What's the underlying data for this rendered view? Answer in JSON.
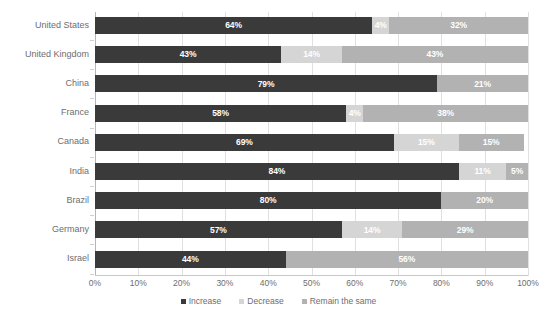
{
  "chart_data": {
    "type": "bar",
    "subtype": "stacked-horizontal-100pct",
    "title": "",
    "xlabel": "",
    "ylabel": "",
    "xlim": [
      0,
      100
    ],
    "xticks": [
      "0%",
      "10%",
      "20%",
      "30%",
      "40%",
      "50%",
      "60%",
      "70%",
      "80%",
      "90%",
      "100%"
    ],
    "xtick_values": [
      0,
      10,
      20,
      30,
      40,
      50,
      60,
      70,
      80,
      90,
      100
    ],
    "grid": true,
    "legend_position": "bottom",
    "categories": [
      "United States",
      "United Kingdom",
      "China",
      "France",
      "Canada",
      "India",
      "Brazil",
      "Germany",
      "Israel"
    ],
    "series": [
      {
        "name": "Increase",
        "color": "#3a3a3a",
        "values": [
          64,
          43,
          79,
          58,
          69,
          84,
          80,
          57,
          44
        ],
        "labels": [
          "64%",
          "43%",
          "79%",
          "58%",
          "69%",
          "84%",
          "80%",
          "57%",
          "44%"
        ]
      },
      {
        "name": "Decrease",
        "color": "#d5d5d5",
        "values": [
          4,
          14,
          0,
          4,
          15,
          11,
          0,
          14,
          0
        ],
        "labels": [
          "4%",
          "14%",
          "",
          "4%",
          "15%",
          "11%",
          "",
          "14%",
          ""
        ]
      },
      {
        "name": "Remain the same",
        "color": "#b2b2b2",
        "values": [
          32,
          43,
          21,
          38,
          15,
          5,
          20,
          29,
          56
        ],
        "labels": [
          "32%",
          "43%",
          "21%",
          "38%",
          "15%",
          "5%",
          "20%",
          "29%",
          "56%"
        ]
      }
    ],
    "rows": [
      {
        "category": "United States",
        "segments": [
          {
            "series": "Increase",
            "value": 64,
            "label": "64%"
          },
          {
            "series": "Decrease",
            "value": 4,
            "label": "4%"
          },
          {
            "series": "Remain the same",
            "value": 32,
            "label": "32%"
          }
        ]
      },
      {
        "category": "United Kingdom",
        "segments": [
          {
            "series": "Increase",
            "value": 43,
            "label": "43%"
          },
          {
            "series": "Decrease",
            "value": 14,
            "label": "14%"
          },
          {
            "series": "Remain the same",
            "value": 43,
            "label": "43%"
          }
        ]
      },
      {
        "category": "China",
        "segments": [
          {
            "series": "Increase",
            "value": 79,
            "label": "79%"
          },
          {
            "series": "Decrease",
            "value": 0,
            "label": ""
          },
          {
            "series": "Remain the same",
            "value": 21,
            "label": "21%"
          }
        ]
      },
      {
        "category": "France",
        "segments": [
          {
            "series": "Increase",
            "value": 58,
            "label": "58%"
          },
          {
            "series": "Decrease",
            "value": 4,
            "label": "4%"
          },
          {
            "series": "Remain the same",
            "value": 38,
            "label": "38%"
          }
        ]
      },
      {
        "category": "Canada",
        "segments": [
          {
            "series": "Increase",
            "value": 69,
            "label": "69%"
          },
          {
            "series": "Decrease",
            "value": 15,
            "label": "15%"
          },
          {
            "series": "Remain the same",
            "value": 15,
            "label": "15%"
          }
        ]
      },
      {
        "category": "India",
        "segments": [
          {
            "series": "Increase",
            "value": 84,
            "label": "84%"
          },
          {
            "series": "Decrease",
            "value": 11,
            "label": "11%"
          },
          {
            "series": "Remain the same",
            "value": 5,
            "label": "5%"
          }
        ]
      },
      {
        "category": "Brazil",
        "segments": [
          {
            "series": "Increase",
            "value": 80,
            "label": "80%"
          },
          {
            "series": "Decrease",
            "value": 0,
            "label": ""
          },
          {
            "series": "Remain the same",
            "value": 20,
            "label": "20%"
          }
        ]
      },
      {
        "category": "Germany",
        "segments": [
          {
            "series": "Increase",
            "value": 57,
            "label": "57%"
          },
          {
            "series": "Decrease",
            "value": 14,
            "label": "14%"
          },
          {
            "series": "Remain the same",
            "value": 29,
            "label": "29%"
          }
        ]
      },
      {
        "category": "Israel",
        "segments": [
          {
            "series": "Increase",
            "value": 44,
            "label": "44%"
          },
          {
            "series": "Decrease",
            "value": 0,
            "label": ""
          },
          {
            "series": "Remain the same",
            "value": 56,
            "label": "56%"
          }
        ]
      }
    ],
    "legend": [
      {
        "label": "Increase",
        "color": "#3a3a3a"
      },
      {
        "label": "Decrease",
        "color": "#d5d5d5"
      },
      {
        "label": "Remain the same",
        "color": "#b2b2b2"
      }
    ]
  }
}
